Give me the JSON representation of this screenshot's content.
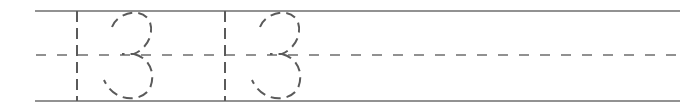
{
  "worksheet": {
    "type": "handwriting-tracing-row",
    "traced_text": "13",
    "repetitions": 2,
    "guide_lines": {
      "top": {
        "y": 11,
        "style": "solid"
      },
      "midline": {
        "y": 55,
        "style": "dashed"
      },
      "baseline": {
        "y": 101,
        "style": "solid"
      }
    },
    "colors": {
      "line": "#6e6e6e",
      "trace": "#5a5a5a",
      "background": "#ffffff"
    },
    "glyphs": [
      {
        "char": "1",
        "x": 77
      },
      {
        "char": "3",
        "x": 128
      },
      {
        "char": "1",
        "x": 225
      },
      {
        "char": "3",
        "x": 274
      }
    ]
  }
}
